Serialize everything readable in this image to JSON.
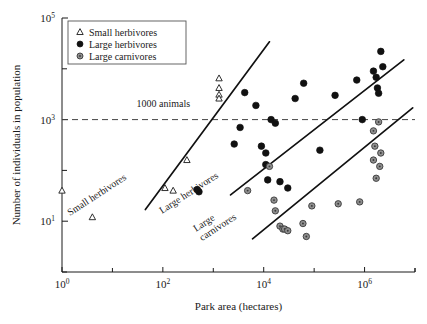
{
  "chart_data": {
    "type": "scatter",
    "title": "",
    "xlabel": "Park area (hectares)",
    "ylabel": "Number of individuals in population",
    "xscale": "log",
    "yscale": "log",
    "xlim": [
      1,
      10000000
    ],
    "ylim": [
      1,
      100000
    ],
    "grid": false,
    "xticks": [
      {
        "value": 1,
        "mantissa": "10",
        "exponent": "0",
        "label": "10^0",
        "major": true
      },
      {
        "value": 100,
        "mantissa": "10",
        "exponent": "2",
        "label": "10^2",
        "major": true
      },
      {
        "value": 10000,
        "mantissa": "10",
        "exponent": "4",
        "label": "10^4",
        "major": true
      },
      {
        "value": 1000000,
        "mantissa": "10",
        "exponent": "6",
        "label": "10^6",
        "major": true
      }
    ],
    "xminorticks": [
      10,
      1000,
      100000,
      10000000
    ],
    "yticks": [
      {
        "value": 100000,
        "mantissa": "10",
        "exponent": "5",
        "label": "10^5",
        "major": true
      },
      {
        "value": 1000,
        "mantissa": "10",
        "exponent": "3",
        "label": "10^3",
        "major": true
      },
      {
        "value": 10,
        "mantissa": "10",
        "exponent": "1",
        "label": "10^1",
        "major": true
      }
    ],
    "yminorticks": [
      10000,
      100,
      1
    ],
    "legend": {
      "position": "top-left",
      "entries": [
        {
          "label": "Small herbivores",
          "marker": "triangle-open",
          "color": "#ffffff",
          "edge": "#1a1a1a"
        },
        {
          "label": "Large herbivores",
          "marker": "circle-filled",
          "color": "#111111",
          "edge": "#111111"
        },
        {
          "label": "Large carnivores",
          "marker": "circle-gray",
          "color": "#8f8f8f",
          "edge": "#3a3a3a"
        }
      ]
    },
    "annotations": [
      {
        "name": "thousand-animals",
        "text": "1000 animals",
        "x": 30,
        "y": 1800
      },
      {
        "name": "small-herbivores-trend-label",
        "text": "Small herbivores",
        "rotation": -33
      },
      {
        "name": "large-herbivores-trend-label",
        "text": "Large herbivores",
        "rotation": -33
      },
      {
        "name": "large-carnivores-trend-label",
        "text": "Large carnivores",
        "rotation": -33
      }
    ],
    "reference_lines": [
      {
        "name": "thousand-animals-line",
        "orientation": "horizontal",
        "y": 1000,
        "style": "dashed",
        "color": "#444444"
      }
    ],
    "trend_lines": [
      {
        "name": "small-herbivores-trend",
        "series": "Small herbivores",
        "x0": 45,
        "y0": 17,
        "x1": 13000,
        "y1": 34000
      },
      {
        "name": "large-herbivores-trend",
        "series": "Large herbivores",
        "x0": 2200,
        "y0": 33,
        "x1": 6000000,
        "y1": 15000
      },
      {
        "name": "large-carnivores-trend",
        "series": "Large carnivores",
        "x0": 6000,
        "y0": 4.5,
        "x1": 9000000,
        "y1": 1700
      }
    ],
    "series": [
      {
        "name": "Small herbivores",
        "marker": "triangle-open",
        "color": "#ffffff",
        "edge": "#1a1a1a",
        "points": [
          {
            "x": 1.0,
            "y": 40
          },
          {
            "x": 4.0,
            "y": 12
          },
          {
            "x": 110,
            "y": 45
          },
          {
            "x": 160,
            "y": 40
          },
          {
            "x": 300,
            "y": 160
          },
          {
            "x": 1300,
            "y": 6500
          },
          {
            "x": 1300,
            "y": 4200
          },
          {
            "x": 1300,
            "y": 3100
          },
          {
            "x": 1300,
            "y": 2600
          }
        ]
      },
      {
        "name": "Large herbivores",
        "marker": "circle-filled",
        "color": "#111111",
        "edge": "#111111",
        "points": [
          {
            "x": 480,
            "y": 42
          },
          {
            "x": 520,
            "y": 38
          },
          {
            "x": 2600,
            "y": 330
          },
          {
            "x": 3400,
            "y": 700
          },
          {
            "x": 4200,
            "y": 3400
          },
          {
            "x": 7000,
            "y": 1900
          },
          {
            "x": 9000,
            "y": 300
          },
          {
            "x": 11000,
            "y": 220
          },
          {
            "x": 11000,
            "y": 130
          },
          {
            "x": 12000,
            "y": 65
          },
          {
            "x": 14000,
            "y": 1000
          },
          {
            "x": 17000,
            "y": 850
          },
          {
            "x": 21000,
            "y": 60
          },
          {
            "x": 30000,
            "y": 45
          },
          {
            "x": 42000,
            "y": 2600
          },
          {
            "x": 62000,
            "y": 5200
          },
          {
            "x": 130000,
            "y": 250
          },
          {
            "x": 260000,
            "y": 3000
          },
          {
            "x": 700000,
            "y": 6000
          },
          {
            "x": 900000,
            "y": 1000
          },
          {
            "x": 1500000,
            "y": 9000
          },
          {
            "x": 1700000,
            "y": 6800
          },
          {
            "x": 1800000,
            "y": 4200
          },
          {
            "x": 1900000,
            "y": 3300
          },
          {
            "x": 2100000,
            "y": 22000
          },
          {
            "x": 2300000,
            "y": 11000
          }
        ]
      },
      {
        "name": "Large carnivores",
        "marker": "circle-gray",
        "color": "#8f8f8f",
        "edge": "#3a3a3a",
        "points": [
          {
            "x": 4800,
            "y": 40
          },
          {
            "x": 13000,
            "y": 120
          },
          {
            "x": 16000,
            "y": 26
          },
          {
            "x": 17000,
            "y": 16
          },
          {
            "x": 21000,
            "y": 8
          },
          {
            "x": 24000,
            "y": 7
          },
          {
            "x": 26000,
            "y": 7
          },
          {
            "x": 30000,
            "y": 6.5
          },
          {
            "x": 60000,
            "y": 9
          },
          {
            "x": 70000,
            "y": 5
          },
          {
            "x": 90000,
            "y": 20
          },
          {
            "x": 300000,
            "y": 22
          },
          {
            "x": 800000,
            "y": 24
          },
          {
            "x": 2000000,
            "y": 120
          },
          {
            "x": 1500000,
            "y": 600
          },
          {
            "x": 1600000,
            "y": 300
          },
          {
            "x": 1500000,
            "y": 160
          },
          {
            "x": 1900000,
            "y": 900
          },
          {
            "x": 2100000,
            "y": 220
          },
          {
            "x": 1700000,
            "y": 70
          }
        ]
      }
    ]
  }
}
